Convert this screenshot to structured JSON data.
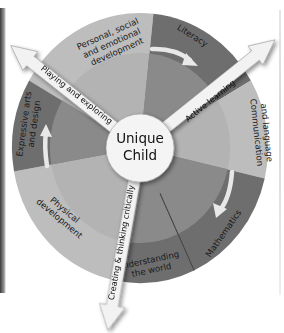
{
  "diagram": {
    "center": {
      "line1": "Unique",
      "line2": "Child"
    },
    "colors": {
      "light_outer": "#bdbdbd",
      "light_inner": "#b2b2b2",
      "dark_outer": "#6e6e6e",
      "dark_inner": "#8a8a8a",
      "center_fill": "#f4f4f4",
      "arrow_fill": "#f2f2f2",
      "divider": "#3c3c3c"
    },
    "segments": [
      {
        "id": "psed",
        "lines": [
          "Personal, social",
          "and emotional",
          "development"
        ],
        "tone": "light"
      },
      {
        "id": "literacy",
        "lines": [
          "Literacy"
        ],
        "tone": "dark"
      },
      {
        "id": "communication",
        "lines": [
          "Communication",
          "and language"
        ],
        "tone": "light"
      },
      {
        "id": "mathematics",
        "lines": [
          "Mathematics"
        ],
        "tone": "dark"
      },
      {
        "id": "understanding",
        "lines": [
          "Understanding",
          "the world"
        ],
        "tone": "dark"
      },
      {
        "id": "physical",
        "lines": [
          "Physical",
          "development"
        ],
        "tone": "light"
      },
      {
        "id": "expressive",
        "lines": [
          "Expressive arts",
          "and design"
        ],
        "tone": "dark"
      }
    ],
    "arrows": [
      {
        "id": "playing",
        "label": "Playing and exploring"
      },
      {
        "id": "active",
        "label": "Active learning"
      },
      {
        "id": "creating",
        "label": "Creating & thinking critically"
      }
    ]
  }
}
